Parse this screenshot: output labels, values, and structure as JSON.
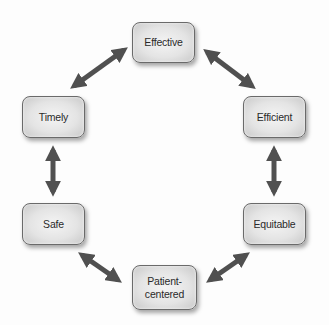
{
  "diagram": {
    "type": "cycle",
    "nodes": [
      {
        "id": "effective",
        "label": "Effective"
      },
      {
        "id": "efficient",
        "label": "Efficient"
      },
      {
        "id": "equitable",
        "label": "Equitable"
      },
      {
        "id": "patient_centered",
        "label_line1": "Patient-",
        "label_line2": "centered"
      },
      {
        "id": "safe",
        "label": "Safe"
      },
      {
        "id": "timely",
        "label": "Timely"
      }
    ],
    "edges": [
      {
        "from": "effective",
        "to": "efficient",
        "style": "double-arrow"
      },
      {
        "from": "efficient",
        "to": "equitable",
        "style": "double-arrow"
      },
      {
        "from": "equitable",
        "to": "patient_centered",
        "style": "double-arrow"
      },
      {
        "from": "patient_centered",
        "to": "safe",
        "style": "double-arrow"
      },
      {
        "from": "safe",
        "to": "timely",
        "style": "double-arrow"
      },
      {
        "from": "timely",
        "to": "effective",
        "style": "double-arrow"
      }
    ],
    "colors": {
      "arrow": "#505050",
      "node_border": "#6a6a6a",
      "node_fill": "#e4e4e4",
      "text": "#2a2a2a"
    }
  }
}
